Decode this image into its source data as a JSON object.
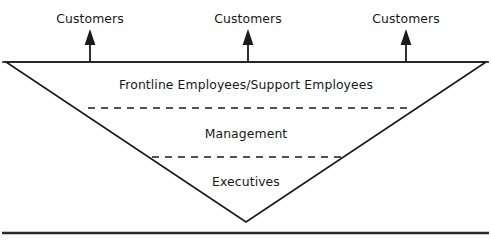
{
  "figure": {
    "type": "inverted-pyramid-organization-chart",
    "background_color": "#ffffff",
    "line_color": "#1a1a1a",
    "text_color": "#171717",
    "frame": {
      "top_rule_y": 62,
      "bottom_rule_y": 233,
      "top_rule_thickness": 1.6,
      "bottom_rule_thickness": 2.4
    },
    "customers": [
      {
        "label": "Customers",
        "x": 90,
        "y": 19,
        "arrow_x": 90
      },
      {
        "label": "Customers",
        "x": 248,
        "y": 19,
        "arrow_x": 248
      },
      {
        "label": "Customers",
        "x": 406,
        "y": 19,
        "arrow_x": 406
      }
    ],
    "arrows": {
      "count": 3,
      "direction": "up",
      "tip_y": 30,
      "tail_y": 62,
      "shaft_width": 1.8,
      "head_width": 11,
      "head_height": 15,
      "color": "#1a1a1a"
    },
    "triangle": {
      "left_vertex": {
        "x": 6,
        "y": 62
      },
      "right_vertex": {
        "x": 486,
        "y": 62
      },
      "apex": {
        "x": 246,
        "y": 222
      },
      "stroke_width": 1.6
    },
    "tiers": [
      {
        "label": "Frontline Employees/Support Employees",
        "x": 246,
        "y": 85,
        "divider_below": {
          "type": "dashed",
          "y": 108,
          "x1": 88,
          "x2": 410,
          "dash": "7 6",
          "width": 1.7
        }
      },
      {
        "label": "Management",
        "x": 246,
        "y": 134,
        "divider_below": {
          "type": "dashed",
          "y": 157,
          "x1": 152,
          "x2": 343,
          "dash": "7 6",
          "width": 1.7
        }
      },
      {
        "label": "Executives",
        "x": 246,
        "y": 182,
        "divider_below": null
      }
    ],
    "caption_remnant": ". . ."
  }
}
